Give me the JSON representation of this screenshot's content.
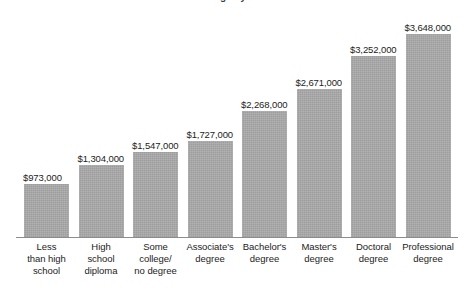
{
  "chart_data": {
    "type": "bar",
    "title": "Lifetime earnings by education level",
    "subtitle": "",
    "xlabel": "",
    "ylabel": "",
    "grid": false,
    "legend": "none",
    "ylim": [
      0,
      3648000
    ],
    "categories": [
      "Less than high school",
      "High school diploma",
      "Some college/ no degree",
      "Associate's degree",
      "Bachelor's degree",
      "Master's degree",
      "Doctoral degree",
      "Professional degree"
    ],
    "category_lines": [
      [
        "Less",
        "than high",
        "school"
      ],
      [
        "High",
        "school",
        "diploma"
      ],
      [
        "Some",
        "college/",
        "no degree"
      ],
      [
        "Associate's",
        "degree"
      ],
      [
        "Bachelor's",
        "degree"
      ],
      [
        "Master's",
        "degree"
      ],
      [
        "Doctoral",
        "degree"
      ],
      [
        "Professional",
        "degree"
      ]
    ],
    "values": [
      973000,
      1304000,
      1547000,
      1727000,
      2268000,
      2671000,
      3252000,
      3648000
    ],
    "value_labels": [
      "$973,000",
      "$1,304,000",
      "$1,547,000",
      "$1,727,000",
      "$2,268,000",
      "$2,671,000",
      "$3,252,000",
      "$3,648,000"
    ],
    "bar_color": "#a9a9a9",
    "axis_color": "#8d8d8d",
    "text_color": "#1c1c1c",
    "background": "#ffffff"
  },
  "layout": {
    "plot_left": 24,
    "bar_width": 45,
    "bar_pitch": 54.5,
    "baseline_y": 237,
    "max_bar_height": 204
  }
}
